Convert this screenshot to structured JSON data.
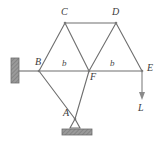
{
  "figure": {
    "kind": "truss-free-body-diagram",
    "width": 161,
    "height": 142,
    "background_color": "#ffffff",
    "member_color": "#6e6e6e",
    "hatch_color": "#8c8c8c",
    "label_color": "#3b3b3b"
  },
  "nodes": [
    {
      "id": "A",
      "label": "A",
      "x": 75,
      "y": 119,
      "label_x": 63,
      "label_y": 113
    },
    {
      "id": "B",
      "label": "B",
      "x": 39,
      "y": 71,
      "label_x": 36,
      "label_y": 58
    },
    {
      "id": "C",
      "label": "C",
      "x": 65,
      "y": 23,
      "label_x": 61,
      "label_y": 8
    },
    {
      "id": "D",
      "label": "D",
      "x": 116,
      "y": 23,
      "label_x": 113,
      "label_y": 8
    },
    {
      "id": "E",
      "label": "E",
      "x": 142,
      "y": 71,
      "label_x": 147,
      "label_y": 65
    },
    {
      "id": "F",
      "label": "F",
      "x": 89,
      "y": 71,
      "label_x": 90,
      "label_y": 74
    }
  ],
  "members": [
    {
      "from": "B",
      "to": "C"
    },
    {
      "from": "C",
      "to": "D"
    },
    {
      "from": "C",
      "to": "F"
    },
    {
      "from": "D",
      "to": "F"
    },
    {
      "from": "D",
      "to": "E"
    },
    {
      "from": "B",
      "to": "F"
    },
    {
      "from": "F",
      "to": "E"
    },
    {
      "from": "B",
      "to": "A"
    },
    {
      "from": "A",
      "to": "F"
    }
  ],
  "dimension_labels": [
    {
      "id": "span-bf",
      "text": "b",
      "x": 62,
      "y": 60
    },
    {
      "id": "span-fe",
      "text": "b",
      "x": 110,
      "y": 60
    }
  ],
  "supports": {
    "wall": {
      "id": "wall-support-b",
      "x": 11,
      "y": 58,
      "width": 8,
      "height": 25,
      "connector_from_x": 19,
      "connector_to_x": 39,
      "connector_y": 71
    },
    "pin": {
      "id": "pin-support-a",
      "apex_x": 75,
      "apex_y": 119,
      "triangle_half_width": 5,
      "triangle_base_y": 128,
      "base_x": 62,
      "base_y": 129,
      "base_width": 30,
      "base_height": 6
    }
  },
  "load": {
    "id": "load-arrow-e",
    "label": "L",
    "from_x": 142,
    "from_y": 71,
    "to_x": 142,
    "to_y": 99,
    "label_x": 139,
    "label_y": 103
  }
}
